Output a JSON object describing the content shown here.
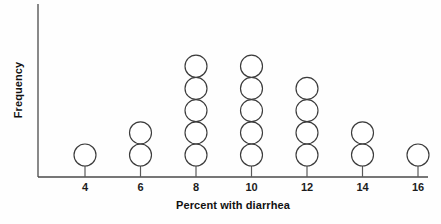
{
  "chart_data": {
    "type": "dot-plot",
    "title": "",
    "xlabel": "Percent with diarrhea",
    "ylabel": "Frequency",
    "categories": [
      "4",
      "6",
      "8",
      "10",
      "12",
      "14",
      "16"
    ],
    "x": [
      4,
      6,
      8,
      10,
      12,
      14,
      16
    ],
    "values": [
      1,
      2,
      5,
      5,
      4,
      2,
      1
    ],
    "tick_labels": [
      "4",
      "6",
      "8",
      "10",
      "12",
      "14",
      "16"
    ],
    "xlim": [
      3,
      17
    ],
    "ylim": [
      0,
      6
    ],
    "grid": false,
    "legend": false,
    "dot_shape": "open-circle",
    "total_count": 20,
    "colors": {
      "axis": "#4a4a4a",
      "dot_stroke": "#3b3b3b",
      "dot_fill": "#ffffff",
      "text": "#111111",
      "background": "#fefefe"
    }
  },
  "axes": {
    "x_title": "Percent with diarrhea",
    "y_title": "Frequency"
  }
}
